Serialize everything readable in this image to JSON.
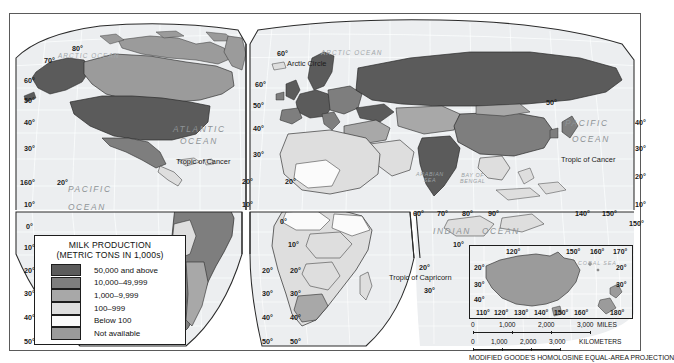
{
  "map": {
    "title": "World Milk Production Thematic Map",
    "projection_note": "MODIFIED GOODE'S HOMOLOSINE EQUAL-AREA PROJECTION"
  },
  "legend": {
    "title_line1": "MILK PRODUCTION",
    "title_line2": "(METRIC TONS IN 1,000s)",
    "classes": [
      {
        "label": "50,000 and above",
        "color": "#5b5b5b"
      },
      {
        "label": "10,000–49,999",
        "color": "#7e7e7e"
      },
      {
        "label": "1,000–9,999",
        "color": "#a8a8a8"
      },
      {
        "label": "100–999",
        "color": "#dedede"
      },
      {
        "label": "Below 100",
        "color": "#fbfbfb"
      },
      {
        "label": "Not available",
        "color": "#9b9b9b"
      }
    ]
  },
  "scale": {
    "miles": {
      "ticks": [
        "0",
        "1,000",
        "2,000",
        "3,000"
      ],
      "unit": "MILES"
    },
    "kilometers": {
      "ticks": [
        "0",
        "1,000",
        "2,000",
        "3,000"
      ],
      "unit": "KILOMETERS"
    }
  },
  "inset": {
    "name": "Australia and New Zealand inset",
    "sea_label": "CORAL SEA",
    "lon_top": [
      "120°",
      "150°",
      "160°",
      "170°"
    ],
    "lon_bottom": [
      "110°",
      "120°",
      "130°",
      "140°",
      "150°",
      "160°",
      "180°"
    ],
    "lat_left": [
      "20°",
      "30°",
      "40°"
    ],
    "lat_right": [
      "20°",
      "30°"
    ]
  },
  "labels": {
    "oceans": [
      {
        "text": "ATLANTIC",
        "x": 163,
        "y": 110
      },
      {
        "text": "OCEAN",
        "x": 170,
        "y": 122
      },
      {
        "text": "PACIFIC",
        "x": 58,
        "y": 170
      },
      {
        "text": "OCEAN",
        "x": 58,
        "y": 188
      },
      {
        "text": "PACIFIC",
        "x": 555,
        "y": 104
      },
      {
        "text": "OCEAN",
        "x": 562,
        "y": 120
      },
      {
        "text": "INDIAN",
        "x": 423,
        "y": 212
      },
      {
        "text": "OCEAN",
        "x": 472,
        "y": 212
      }
    ],
    "arctic_oceans": [
      {
        "text": "ARCTIC OCEAN",
        "x": 48,
        "y": 38
      },
      {
        "text": "ARCTIC OCEAN",
        "x": 311,
        "y": 35
      }
    ],
    "seas": [
      {
        "text": "ARABIAN\nSEA",
        "x": 406,
        "y": 157
      },
      {
        "text": "BAY OF\nBENGAL",
        "x": 450,
        "y": 158
      }
    ],
    "lines": [
      {
        "text": "Arctic Circle",
        "x": 277,
        "y": 45
      },
      {
        "text": "Tropic of Cancer",
        "x": 166,
        "y": 143
      },
      {
        "text": "Tropic of Cancer",
        "x": 551,
        "y": 141
      },
      {
        "text": "Tropic of Capricorn",
        "x": 379,
        "y": 259
      }
    ],
    "graticule": [
      {
        "text": "80°",
        "x": 62,
        "y": 30
      },
      {
        "text": "70°",
        "x": 34,
        "y": 42
      },
      {
        "text": "60°",
        "x": 14,
        "y": 62
      },
      {
        "text": "50°",
        "x": 14,
        "y": 82
      },
      {
        "text": "40°",
        "x": 14,
        "y": 104
      },
      {
        "text": "30°",
        "x": 14,
        "y": 130
      },
      {
        "text": "160°",
        "x": 10,
        "y": 164
      },
      {
        "text": "20°",
        "x": 47,
        "y": 164
      },
      {
        "text": "10°",
        "x": 14,
        "y": 186
      },
      {
        "text": "0°",
        "x": 16,
        "y": 208
      },
      {
        "text": "10°",
        "x": 14,
        "y": 229
      },
      {
        "text": "20°",
        "x": 14,
        "y": 252
      },
      {
        "text": "30°",
        "x": 14,
        "y": 275
      },
      {
        "text": "40°",
        "x": 14,
        "y": 299
      },
      {
        "text": "50°",
        "x": 14,
        "y": 323
      },
      {
        "text": "60°",
        "x": 267,
        "y": 35
      },
      {
        "text": "60°",
        "x": 245,
        "y": 66
      },
      {
        "text": "50°",
        "x": 243,
        "y": 87
      },
      {
        "text": "40°",
        "x": 243,
        "y": 110
      },
      {
        "text": "30°",
        "x": 243,
        "y": 136
      },
      {
        "text": "20°",
        "x": 232,
        "y": 163
      },
      {
        "text": "20°",
        "x": 275,
        "y": 163
      },
      {
        "text": "10°",
        "x": 232,
        "y": 186
      },
      {
        "text": "0°",
        "x": 270,
        "y": 203
      },
      {
        "text": "10°",
        "x": 278,
        "y": 226
      },
      {
        "text": "20°",
        "x": 252,
        "y": 252
      },
      {
        "text": "20°",
        "x": 280,
        "y": 252
      },
      {
        "text": "30°",
        "x": 252,
        "y": 275
      },
      {
        "text": "30°",
        "x": 280,
        "y": 275
      },
      {
        "text": "40°",
        "x": 252,
        "y": 299
      },
      {
        "text": "40°",
        "x": 280,
        "y": 299
      },
      {
        "text": "50°",
        "x": 252,
        "y": 323
      },
      {
        "text": "50°",
        "x": 280,
        "y": 323
      },
      {
        "text": "50°",
        "x": 536,
        "y": 84
      },
      {
        "text": "40°",
        "x": 625,
        "y": 104
      },
      {
        "text": "30°",
        "x": 625,
        "y": 130
      },
      {
        "text": "20°",
        "x": 625,
        "y": 158
      },
      {
        "text": "10°",
        "x": 625,
        "y": 186
      },
      {
        "text": "150°",
        "x": 619,
        "y": 205
      },
      {
        "text": "60°",
        "x": 403,
        "y": 195
      },
      {
        "text": "70°",
        "x": 427,
        "y": 195
      },
      {
        "text": "80°",
        "x": 452,
        "y": 195
      },
      {
        "text": "90°",
        "x": 478,
        "y": 195
      },
      {
        "text": "140°",
        "x": 565,
        "y": 195
      },
      {
        "text": "150°",
        "x": 592,
        "y": 195
      },
      {
        "text": "10°",
        "x": 443,
        "y": 226
      },
      {
        "text": "20°",
        "x": 409,
        "y": 249
      },
      {
        "text": "30°",
        "x": 414,
        "y": 272
      }
    ]
  }
}
